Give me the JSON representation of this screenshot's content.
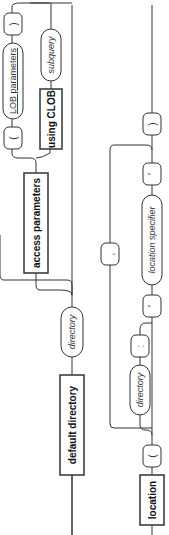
{
  "diagram": {
    "orientation": "rotated-90-ccw",
    "row1": {
      "default_directory": "default directory",
      "directory": "directory",
      "access_parameters": "access parameters",
      "open_paren": "(",
      "lob_parameters": "LOB parameters",
      "close_paren": ")",
      "using_clob": "using CLOB",
      "subquery": "subquery"
    },
    "row2": {
      "location": "location",
      "open_paren": "(",
      "directory": "directory",
      "colon": ":",
      "quote_open": "'",
      "location_specifier": "location specifier",
      "quote_close": "'",
      "comma": ",",
      "close_paren": ")"
    }
  }
}
